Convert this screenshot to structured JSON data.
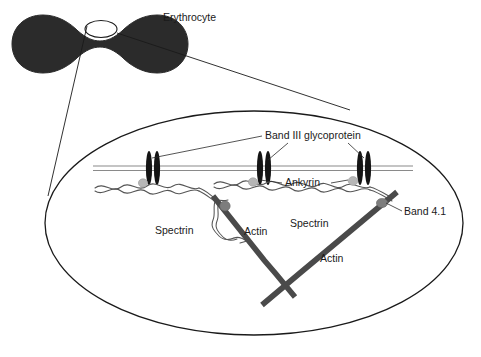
{
  "figure": {
    "background_color": "#ffffff"
  },
  "cell": {
    "label": "Erythrocyte",
    "shape": "biconcave-disc",
    "fill_color": "#2b2b2b",
    "callout_shape": "ellipse"
  },
  "colors": {
    "cell_fill": "#2b2b2b",
    "outline": "#1a1a1a",
    "membrane_line": "#808080",
    "band3_protein": "#141414",
    "ankyrin_node": "#b6b6b6",
    "band41_node": "#7d7d7d",
    "spectrin_filament": "#555555",
    "actin_filament": "#4a4a4a",
    "leader_line": "#2a2a2a",
    "text": "#1a1a1a"
  },
  "labels": {
    "erythrocyte": "Erythrocyte",
    "band3": "Band III glycoprotein",
    "ankyrin": "Ankyrin",
    "spectrin_right": "Spectrin",
    "spectrin_left": "Spectrin",
    "actin_left": "Actin",
    "actin_right": "Actin",
    "band41": "Band 4.1"
  },
  "structures": {
    "membrane": {
      "name": "lipid-bilayer",
      "style": "two parallel thin horizontal lines"
    },
    "band3_count": 3,
    "ankyrin_count": 3,
    "band41_count": 2,
    "actin_count": 2,
    "spectrin_segments": 3
  }
}
